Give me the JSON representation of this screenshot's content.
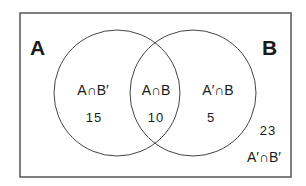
{
  "diagram": {
    "type": "venn",
    "universe": {
      "x": 20,
      "y": 13,
      "width": 271,
      "height": 164,
      "stroke": "#555555"
    },
    "sets": [
      {
        "name": "A",
        "label": "A",
        "cx": 117,
        "cy": 93,
        "r": 63,
        "label_x": 30,
        "label_y": 55
      },
      {
        "name": "B",
        "label": "B",
        "cx": 193,
        "cy": 93,
        "r": 63,
        "label_x": 262,
        "label_y": 55
      }
    ],
    "regions": [
      {
        "id": "a-only",
        "label": "A∩B′",
        "count": "15",
        "label_x": 93,
        "label_y": 95,
        "count_x": 94,
        "count_y": 122
      },
      {
        "id": "a-and-b",
        "label": "A∩B",
        "count": "10",
        "label_x": 156,
        "label_y": 95,
        "count_x": 156,
        "count_y": 122
      },
      {
        "id": "b-only",
        "label": "A′∩B",
        "count": "5",
        "label_x": 218,
        "label_y": 95,
        "count_x": 211,
        "count_y": 122
      },
      {
        "id": "neither",
        "label": "A′∩B′",
        "count": "23",
        "label_x": 264,
        "label_y": 162,
        "count_x": 268,
        "count_y": 135
      }
    ],
    "stroke_color": "#444444",
    "text_color": "#1a1a1a"
  }
}
